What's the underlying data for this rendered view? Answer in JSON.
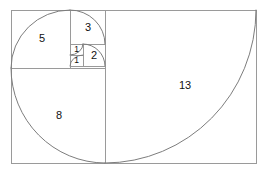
{
  "diagram": {
    "type": "fibonacci-spiral-golden-rectangle",
    "background_color": "#ffffff",
    "line_color": "#9a9a9a",
    "arc_color": "#7d7d7d",
    "label_color": "#111111",
    "outer_rectangle": {
      "x": 11,
      "y": 10,
      "width": 245,
      "height": 153
    },
    "squares": [
      {
        "label": "1",
        "name": "square-1-upper",
        "x": 70,
        "y": 44,
        "width": 13,
        "height": 11,
        "label_x": 76.5,
        "label_y": 50.0,
        "label_size": "tiny"
      },
      {
        "label": "1",
        "name": "square-1-lower",
        "x": 70,
        "y": 55,
        "width": 13,
        "height": 11,
        "label_x": 76.5,
        "label_y": 61.0,
        "label_size": "tiny"
      },
      {
        "label": "2",
        "name": "square-2",
        "x": 83,
        "y": 44,
        "width": 22,
        "height": 22,
        "label_x": 94.0,
        "label_y": 56.0,
        "label_size": "big"
      },
      {
        "label": "3",
        "name": "square-3",
        "x": 70,
        "y": 10,
        "width": 35,
        "height": 34,
        "label_x": 88.0,
        "label_y": 28.0,
        "label_size": "big"
      },
      {
        "label": "5",
        "name": "square-5",
        "x": 11,
        "y": 10,
        "width": 59,
        "height": 58,
        "label_x": 42.0,
        "label_y": 39.0,
        "label_size": "big"
      },
      {
        "label": "8",
        "name": "square-8",
        "x": 11,
        "y": 68,
        "width": 94,
        "height": 95,
        "label_x": 59.0,
        "label_y": 116.0,
        "label_size": "big"
      },
      {
        "label": "13",
        "name": "square-13",
        "x": 105,
        "y": 10,
        "width": 151,
        "height": 153,
        "label_x": 185.0,
        "label_y": 86.0,
        "label_size": "big"
      }
    ],
    "spiral_arcs": [
      {
        "name": "arc-1-lower",
        "path": "M 83 55 A 13 11 0 0 0 70 66"
      },
      {
        "name": "arc-1-upper",
        "path": "M 70 55 A 13 11 0 0 0 83 44"
      },
      {
        "name": "arc-2",
        "path": "M 83 44 A 22 22 0 0 1 105 66"
      },
      {
        "name": "arc-3",
        "path": "M 105 44 A 35 34 0 0 0 70 10"
      },
      {
        "name": "arc-5",
        "path": "M 70 10 A 59 58 0 0 0 11 68"
      },
      {
        "name": "arc-8",
        "path": "M 11 68 A 94 95 0 0 0 105 163"
      },
      {
        "name": "arc-13",
        "path": "M 105 163 A 151 153 0 0 0 256 10"
      }
    ],
    "fibonacci_sequence": [
      1,
      1,
      2,
      3,
      5,
      8,
      13
    ]
  }
}
